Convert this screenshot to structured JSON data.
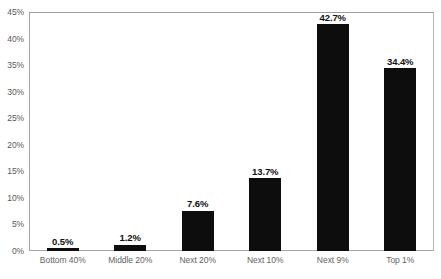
{
  "chart_data": {
    "type": "bar",
    "title": "",
    "subtitle": "",
    "xlabel": "",
    "ylabel": "",
    "categories": [
      "Bottom 40%",
      "Middle 20%",
      "Next 20%",
      "Next 10%",
      "Next 9%",
      "Top 1%"
    ],
    "values": [
      0.5,
      1.2,
      7.6,
      13.7,
      42.7,
      34.4
    ],
    "data_labels": [
      "0.5%",
      "1.2%",
      "7.6%",
      "13.7%",
      "42.7%",
      "34.4%"
    ],
    "ylim": [
      0,
      45
    ],
    "ytick_values": [
      0,
      5,
      10,
      15,
      20,
      25,
      30,
      35,
      40,
      45
    ],
    "ytick_labels": [
      "0%",
      "5%",
      "10%",
      "15%",
      "20%",
      "25%",
      "30%",
      "35%",
      "40%",
      "45%"
    ],
    "grid": false,
    "legend": false,
    "legend_position": "none",
    "bar_color": "#0d0d0d",
    "plot_border_color": "#a6a6a6",
    "axis_label_color": "#636363",
    "data_label_color": "#111111",
    "background_color": "#ffffff"
  }
}
